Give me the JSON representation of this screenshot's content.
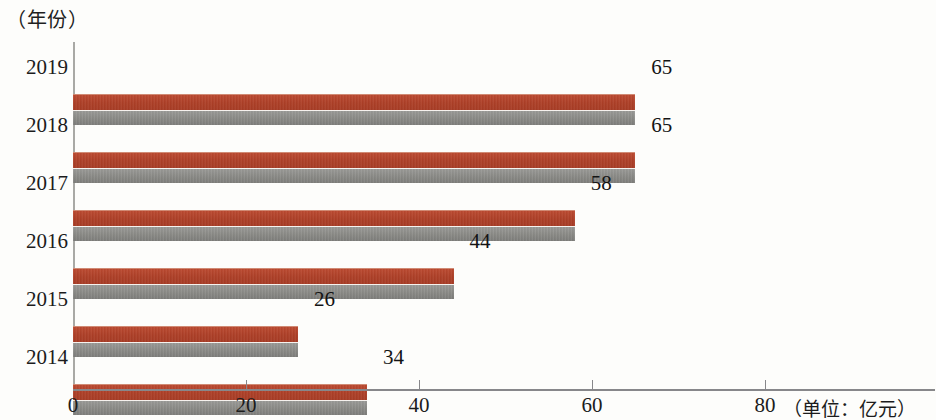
{
  "chart_data": {
    "type": "bar",
    "orientation": "horizontal",
    "title": "",
    "categories": [
      "2019",
      "2018",
      "2017",
      "2016",
      "2015",
      "2014"
    ],
    "values": [
      65,
      65,
      58,
      44,
      26,
      34
    ],
    "data_labels": [
      "65",
      "65",
      "58",
      "44",
      "26",
      "34"
    ],
    "ylabel": "（年份）",
    "xlabel": "（单位：亿元）",
    "xlim": [
      0,
      80
    ],
    "xticks": [
      0,
      20,
      40,
      60,
      80
    ],
    "xtick_labels": [
      "0",
      "20",
      "40",
      "60",
      "80"
    ],
    "grid": false,
    "legend": null,
    "series": [
      {
        "name": "",
        "values": [
          65,
          65,
          58,
          44,
          26,
          34
        ],
        "bar_fill_top_color": "#ad3f27",
        "bar_fill_bottom_color": "#8a8a86"
      }
    ],
    "colors": {
      "bar_red": "#ad3f27",
      "bar_gray": "#8a8a86",
      "axis": "#87878a",
      "text": "#1c1c1c",
      "background": "#fdfdfb"
    }
  }
}
